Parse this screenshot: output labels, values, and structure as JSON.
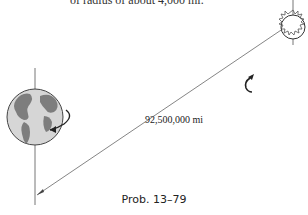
{
  "top_text": "of radius of about 4,000 mi.",
  "distance_label": "92,500,000 mi",
  "caption": "Prob. 13–79",
  "colors": {
    "earth_fill": "#d9d9d9",
    "land": "#808080",
    "line": "#555555"
  }
}
